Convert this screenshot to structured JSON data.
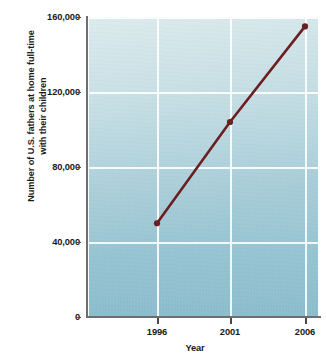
{
  "chart_data": {
    "type": "line",
    "title": "",
    "xlabel": "Year",
    "ylabel": "Number of U.S. fathers at home full-time with their children",
    "ylabel_line1": "Number of U.S. fathers at home full-time",
    "ylabel_line2": "with their children",
    "categories": [
      "1996",
      "2001",
      "2006"
    ],
    "x": [
      1996,
      2001,
      2006
    ],
    "values": [
      50000,
      104000,
      155000
    ],
    "series": [
      {
        "name": "U.S. fathers at home full-time with their children",
        "values": [
          50000,
          104000,
          155000
        ]
      }
    ],
    "x_tick_labels": [
      "1996",
      "2001",
      "2006"
    ],
    "y_tick_labels": [
      "0",
      "40,000",
      "80,000",
      "120,000",
      "160,000"
    ],
    "y_tick_values": [
      0,
      40000,
      80000,
      120000,
      160000
    ],
    "ylim": [
      0,
      160000
    ],
    "xlim": [
      1994,
      2007.8
    ],
    "grid": true,
    "legend": "none",
    "marker": "circle",
    "colors": {
      "line": "#6b1f20",
      "marker": "#6b1f20",
      "plot_background_top": "#cde2e6",
      "plot_background_bottom": "#8cbdcd",
      "gridline": "#ffffff",
      "axis": "#6e6e6e",
      "text": "#1a1a1a",
      "page_background": "#ffffff"
    }
  }
}
